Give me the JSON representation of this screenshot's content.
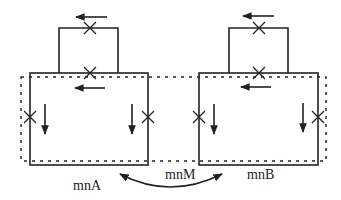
{
  "diagram": {
    "labels": {
      "left": "mnA",
      "middle": "mnM",
      "right": "mnB"
    },
    "colors": {
      "stroke": "#222222",
      "background": "#ffffff"
    },
    "components": [
      {
        "name": "left-loop",
        "label": "mnA",
        "crosses": 4,
        "arrows": [
          "left",
          "left",
          "down",
          "down"
        ]
      },
      {
        "name": "right-loop",
        "label": "mnB",
        "crosses": 4,
        "arrows": [
          "left",
          "left",
          "down",
          "down"
        ]
      }
    ],
    "connector": {
      "label": "mnM",
      "type": "double-headed-curved-arrow"
    }
  }
}
